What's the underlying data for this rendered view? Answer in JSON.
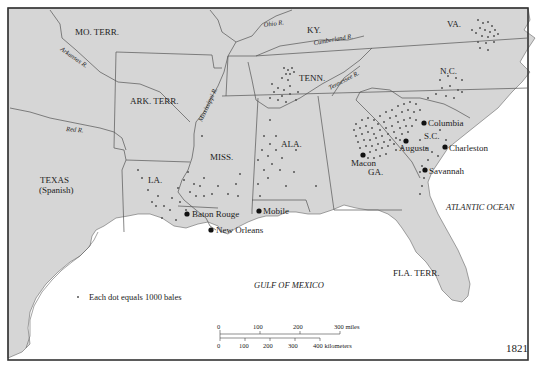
{
  "map": {
    "year": "1821",
    "legend": {
      "dot_meaning": "Each dot equals 1000 bales"
    },
    "colors": {
      "land": "#d6d6d6",
      "water": "#ffffff",
      "border": "#555555",
      "dot": "#555555",
      "city": "#111111",
      "frame": "#333333"
    },
    "regions": [
      {
        "id": "mo",
        "label": "MO. TERR."
      },
      {
        "id": "ky",
        "label": "KY."
      },
      {
        "id": "va",
        "label": "VA."
      },
      {
        "id": "tenn",
        "label": "TENN."
      },
      {
        "id": "nc",
        "label": "N.C."
      },
      {
        "id": "ark",
        "label": "ARK. TERR."
      },
      {
        "id": "miss",
        "label": "MISS."
      },
      {
        "id": "ala",
        "label": "ALA."
      },
      {
        "id": "sc",
        "label": "S.C."
      },
      {
        "id": "ga",
        "label": "GA."
      },
      {
        "id": "la",
        "label": "LA."
      },
      {
        "id": "texas",
        "label": "TEXAS",
        "sublabel": "(Spanish)"
      },
      {
        "id": "fla",
        "label": "FLA. TERR."
      }
    ],
    "rivers": [
      {
        "id": "ohio",
        "label": "Ohio R."
      },
      {
        "id": "cumberland",
        "label": "Cumberland R."
      },
      {
        "id": "arkansas",
        "label": "Arkansas R."
      },
      {
        "id": "mississippi",
        "label": "Mississippi R."
      },
      {
        "id": "tennessee",
        "label": "Tennessee R."
      },
      {
        "id": "red",
        "label": "Red R."
      }
    ],
    "water_bodies": [
      {
        "id": "gulf",
        "label": "GULF OF MEXICO"
      },
      {
        "id": "atlantic",
        "label": "ATLANTIC OCEAN"
      }
    ],
    "cities": [
      {
        "id": "columbia",
        "label": "Columbia"
      },
      {
        "id": "augusta",
        "label": "Augusta"
      },
      {
        "id": "charleston",
        "label": "Charleston"
      },
      {
        "id": "macon",
        "label": "Macon"
      },
      {
        "id": "savannah",
        "label": "Savannah"
      },
      {
        "id": "baton_rouge",
        "label": "Baton Rouge"
      },
      {
        "id": "new_orleans",
        "label": "New Orleans"
      },
      {
        "id": "mobile",
        "label": "Mobile"
      }
    ],
    "scale_bar": {
      "miles_ticks": [
        "0",
        "100",
        "200",
        "300 miles"
      ],
      "km_ticks": [
        "0",
        "100",
        "200",
        "300",
        "400 kilometers"
      ]
    }
  }
}
